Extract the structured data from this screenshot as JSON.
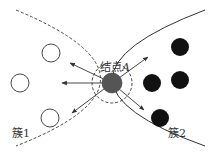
{
  "diagram": {
    "type": "cluster-boundary-diagram",
    "labels": {
      "node": "结点",
      "node_var": "A",
      "cluster1": "簇1",
      "cluster2": "簇2"
    },
    "colors": {
      "stroke": "#333333",
      "hollow_fill": "#ffffff",
      "solid_fill": "#111111",
      "node_fill": "#555555",
      "background": "#ffffff"
    },
    "cluster1": {
      "style": "hollow",
      "points": [
        [
          51,
          53
        ],
        [
          20,
          83
        ],
        [
          50,
          118
        ]
      ],
      "radius": 9
    },
    "cluster2": {
      "style": "filled",
      "points": [
        [
          180,
          47
        ],
        [
          152,
          83
        ],
        [
          180,
          80
        ],
        [
          160,
          118
        ]
      ],
      "radius": 9
    },
    "node_A": {
      "center": [
        112,
        83
      ],
      "radius": 10,
      "neighborhood_radius": 20
    },
    "arrows": [
      {
        "to": [
          70,
          63
        ]
      },
      {
        "to": [
          62,
          83
        ]
      },
      {
        "to": [
          72,
          113
        ]
      },
      {
        "to": [
          148,
          57
        ]
      },
      {
        "to": [
          144,
          110
        ]
      }
    ]
  }
}
